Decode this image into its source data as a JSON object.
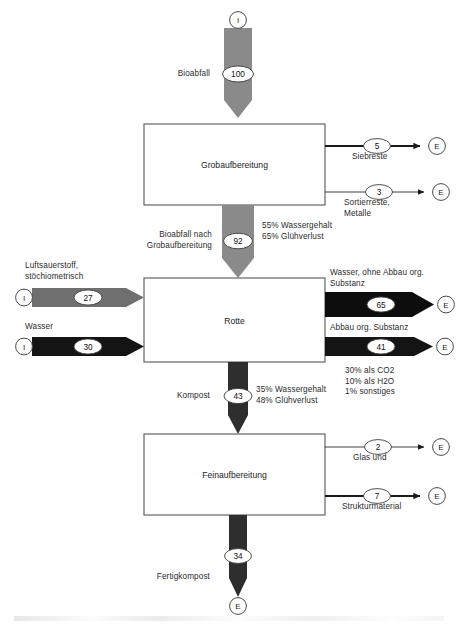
{
  "diagram": {
    "type": "material-flow-sankey",
    "colors": {
      "gray_flow": "#8a8a8a",
      "dark_flow": "#2e2e2e",
      "black_flow": "#121212",
      "box_stroke": "#555555",
      "text": "#2b2b2b",
      "background": "#ffffff"
    },
    "terminal_symbols": {
      "input": "I",
      "export": "E"
    },
    "processes": [
      {
        "id": "grobaufbereitung",
        "label": "Grobaufbereitung"
      },
      {
        "id": "rotte",
        "label": "Rotte"
      },
      {
        "id": "feinaufbereitung",
        "label": "Feinaufbereitung"
      }
    ],
    "flows": [
      {
        "id": "bioabfall-in",
        "label": "Bioabfall",
        "value": "100",
        "from": "I",
        "to": "grobaufbereitung",
        "direction": "down",
        "style": "gray"
      },
      {
        "id": "siebreste",
        "label": "Siebreste",
        "value": "5",
        "from": "grobaufbereitung",
        "to": "E",
        "direction": "right",
        "style": "thick-line"
      },
      {
        "id": "sortierreste-metalle",
        "label": "Sortierreste,\nMetalle",
        "value": "3",
        "from": "grobaufbereitung",
        "to": "E",
        "direction": "right",
        "style": "thin-line"
      },
      {
        "id": "bioabfall-nach-grob",
        "label": "Bioabfall nach\nGrobaufbereitung",
        "value": "92",
        "from": "grobaufbereitung",
        "to": "rotte",
        "direction": "down",
        "style": "gray",
        "annotation": "55% Wassergehalt\n65% Glühverlust"
      },
      {
        "id": "luftsauerstoff",
        "label": "Luftsauerstoff,\nstöchiometrisch",
        "value": "27",
        "from": "I",
        "to": "rotte",
        "direction": "right",
        "style": "gray"
      },
      {
        "id": "wasser-in",
        "label": "Wasser",
        "value": "30",
        "from": "I",
        "to": "rotte",
        "direction": "right",
        "style": "black"
      },
      {
        "id": "wasser-ohne-abbau",
        "label": "Wasser, ohne Abbau org.\nSubstanz",
        "value": "65",
        "from": "rotte",
        "to": "E",
        "direction": "right",
        "style": "black"
      },
      {
        "id": "abbau-org-substanz",
        "label": "Abbau org. Substanz",
        "value": "41",
        "from": "rotte",
        "to": "E",
        "direction": "right",
        "style": "black",
        "annotation": "30% als CO2\n10% als H2O\n1% sonstiges"
      },
      {
        "id": "kompost",
        "label": "Kompost",
        "value": "43",
        "from": "rotte",
        "to": "feinaufbereitung",
        "direction": "down",
        "style": "dark",
        "annotation": "35% Wassergehalt\n48% Glühverlust"
      },
      {
        "id": "glas-und",
        "label": "Glas und",
        "value": "2",
        "from": "feinaufbereitung",
        "to": "E",
        "direction": "right",
        "style": "thin-line"
      },
      {
        "id": "strukturmaterial",
        "label": "Strukturmaterial",
        "value": "7",
        "from": "feinaufbereitung",
        "to": "E",
        "direction": "right",
        "style": "thick-line"
      },
      {
        "id": "fertigkompost",
        "label": "Fertigkompost",
        "value": "34",
        "from": "feinaufbereitung",
        "to": "E",
        "direction": "down",
        "style": "dark"
      }
    ]
  }
}
